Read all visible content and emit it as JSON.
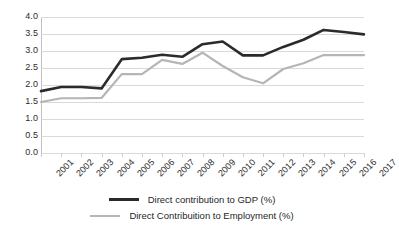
{
  "chart_data": {
    "type": "line",
    "title": "",
    "xlabel": "",
    "ylabel": "",
    "categories": [
      "2001",
      "2002",
      "2003",
      "2004",
      "2005",
      "2006",
      "2007",
      "2008",
      "2009",
      "2010",
      "2011",
      "2012",
      "2013",
      "2014",
      "2015",
      "2016",
      "2017"
    ],
    "ylim": [
      0.0,
      4.0
    ],
    "ytick_step": 0.5,
    "yticks": [
      "0.0",
      "0.5",
      "1.0",
      "1.5",
      "2.0",
      "2.5",
      "3.0",
      "3.5",
      "4.0"
    ],
    "grid": true,
    "legend_position": "bottom",
    "series": [
      {
        "name": "Direct contribution to GDP (%)",
        "color": "#2b2b2b",
        "width": 2.6,
        "values": [
          1.82,
          1.94,
          1.94,
          1.9,
          2.76,
          2.8,
          2.89,
          2.83,
          3.2,
          3.28,
          2.87,
          2.87,
          3.12,
          3.33,
          3.62,
          3.56,
          3.49
        ]
      },
      {
        "name": "Direct Contribuition to Employment (%)",
        "color": "#b5b5b5",
        "width": 2.2,
        "values": [
          1.5,
          1.61,
          1.61,
          1.62,
          2.32,
          2.32,
          2.74,
          2.62,
          2.95,
          2.56,
          2.23,
          2.05,
          2.47,
          2.64,
          2.88,
          2.88,
          2.88
        ]
      }
    ]
  },
  "legend": {
    "items": [
      {
        "label": "Direct contribution to GDP (%)",
        "color": "#2b2b2b"
      },
      {
        "label": "Direct Contribuition to Employment (%)",
        "color": "#b5b5b5"
      }
    ]
  }
}
